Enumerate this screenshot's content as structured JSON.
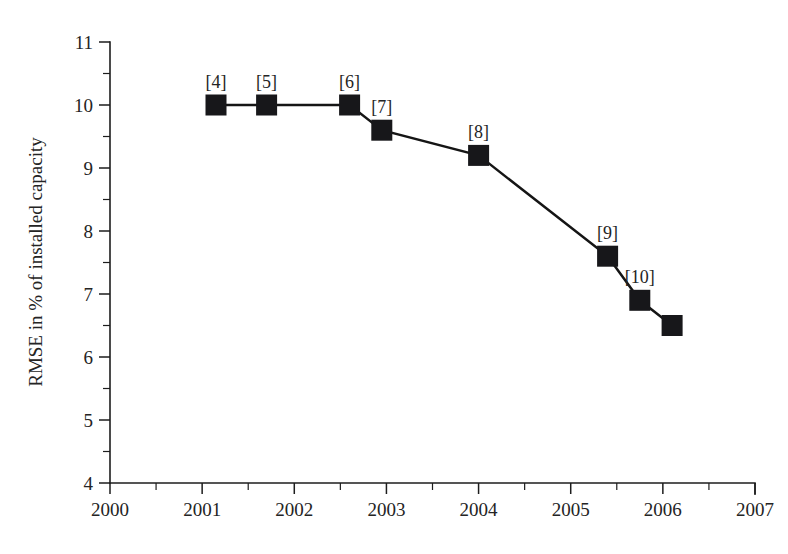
{
  "chart_data": {
    "type": "line",
    "title": "",
    "subtitle": "",
    "xlabel": "",
    "ylabel": "RMSE in % of installed capacity",
    "xlim": [
      2000,
      2007
    ],
    "ylim": [
      4,
      11
    ],
    "x_ticks": [
      2000,
      2001,
      2002,
      2003,
      2004,
      2005,
      2006,
      2007
    ],
    "x_tick_labels": [
      "2000",
      "2001",
      "2002",
      "2003",
      "2004",
      "2005",
      "2006",
      "2007"
    ],
    "x_minor_tick_step": 0.5,
    "y_ticks": [
      4,
      5,
      6,
      7,
      8,
      9,
      10,
      11
    ],
    "y_tick_labels": [
      "4",
      "5",
      "6",
      "7",
      "8",
      "9",
      "10",
      "11"
    ],
    "y_minor_tick_step": 0.5,
    "grid": false,
    "legend": "none",
    "marker_style": "filled-square",
    "marker_color": "#17171a",
    "line_color": "#151515",
    "background_color": "#ffffff",
    "series": [
      {
        "name": "RMSE of wind power forecast",
        "x": [
          2001.15,
          2001.7,
          2002.6,
          2002.95,
          2004.0,
          2005.4,
          2005.75,
          2006.1
        ],
        "y": [
          10.0,
          10.0,
          10.0,
          9.6,
          9.2,
          7.6,
          6.9,
          6.5
        ],
        "point_labels": [
          "[4]",
          "[5]",
          "[6]",
          "[7]",
          "[8]",
          "[9]",
          "[10]",
          ""
        ]
      }
    ],
    "annotations": [
      {
        "text": "[4]",
        "x": 2001.15,
        "y": 10.0
      },
      {
        "text": "[5]",
        "x": 2001.7,
        "y": 10.0
      },
      {
        "text": "[6]",
        "x": 2002.6,
        "y": 10.0
      },
      {
        "text": "[7]",
        "x": 2002.95,
        "y": 9.6
      },
      {
        "text": "[8]",
        "x": 2004.0,
        "y": 9.2
      },
      {
        "text": "[9]",
        "x": 2005.4,
        "y": 7.6
      },
      {
        "text": "[10]",
        "x": 2005.75,
        "y": 6.9
      }
    ]
  }
}
